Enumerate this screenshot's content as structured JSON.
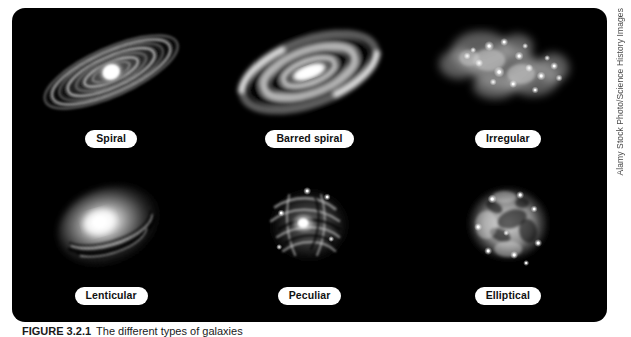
{
  "figure": {
    "background_color": "#000000",
    "page_color": "#ffffff",
    "label_pill_color": "#ffffff",
    "label_text_color": "#111111",
    "galaxies": [
      {
        "id": "spiral",
        "label": "Spiral",
        "art": "spiral-galaxy-illustration"
      },
      {
        "id": "barred-spiral",
        "label": "Barred spiral",
        "art": "barred-spiral-galaxy-illustration"
      },
      {
        "id": "irregular",
        "label": "Irregular",
        "art": "irregular-galaxy-illustration"
      },
      {
        "id": "lenticular",
        "label": "Lenticular",
        "art": "lenticular-galaxy-illustration"
      },
      {
        "id": "peculiar",
        "label": "Peculiar",
        "art": "peculiar-galaxy-illustration"
      },
      {
        "id": "elliptical",
        "label": "Elliptical",
        "art": "elliptical-galaxy-illustration"
      }
    ]
  },
  "watermark": {
    "text": "Alamy Stock Photo/Science History Images"
  },
  "caption": {
    "label": "FIGURE 3.2.1",
    "text": "The different types of galaxies"
  }
}
